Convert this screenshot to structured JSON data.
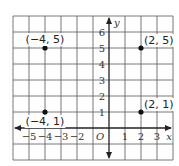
{
  "chart_data": {
    "type": "scatter",
    "title": "",
    "xlabel": "x",
    "ylabel": "y",
    "origin_label": "O",
    "xlim": [
      -6,
      4
    ],
    "ylim": [
      -2,
      7
    ],
    "grid": true,
    "x_ticks": [
      -5,
      -4,
      -3,
      -2,
      1,
      2,
      3
    ],
    "x_tick_labels": [
      "−5",
      "−4",
      "−3",
      "−2",
      "1",
      "2",
      "3"
    ],
    "y_ticks": [
      1,
      2,
      3,
      4,
      5,
      6
    ],
    "y_tick_labels": [
      "1",
      "2",
      "3",
      "4",
      "5",
      "6"
    ],
    "points": [
      {
        "x": -4,
        "y": 5,
        "label": "(−4, 5)"
      },
      {
        "x": 2,
        "y": 5,
        "label": "(2, 5)"
      },
      {
        "x": -4,
        "y": 1,
        "label": "(−4, 1)"
      },
      {
        "x": 2,
        "y": 1,
        "label": "(2, 1)"
      }
    ],
    "colors": {
      "grid": "#555555",
      "axis": "#222222",
      "point": "#111111"
    }
  }
}
